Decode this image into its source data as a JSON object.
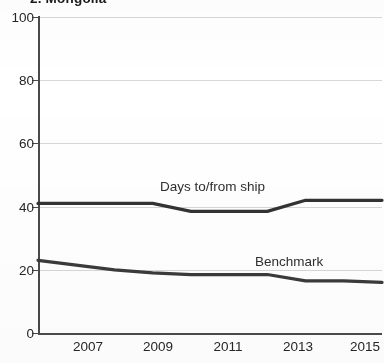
{
  "chart_data": {
    "type": "line",
    "title": "2. Mongolia",
    "xlabel": "",
    "ylabel": "",
    "xlim": [
      2006,
      2015
    ],
    "ylim": [
      0,
      100
    ],
    "grid": true,
    "legend_position": "inline-annotation",
    "x": [
      2006,
      2007,
      2008,
      2009,
      2010,
      2011,
      2012,
      2013,
      2014,
      2015
    ],
    "xtick_labels": [
      "2007",
      "2009",
      "2011",
      "2013",
      "2015"
    ],
    "xtick_values": [
      2007,
      2009,
      2011,
      2013,
      2015
    ],
    "ytick_labels": [
      "0",
      "20",
      "40",
      "60",
      "80",
      "100"
    ],
    "ytick_values": [
      0,
      20,
      40,
      60,
      80,
      100
    ],
    "series": [
      {
        "name": "Days to/from ship",
        "color": "#333333",
        "values": [
          41,
          41,
          41,
          41,
          38.5,
          38.5,
          38.5,
          42,
          42,
          42
        ]
      },
      {
        "name": "Benchmark",
        "color": "#3a3a3a",
        "values": [
          23,
          21.5,
          20,
          19,
          18.5,
          18.5,
          18.5,
          16.5,
          16.5,
          16
        ]
      }
    ]
  },
  "annotations": {
    "series_labels": [
      {
        "text": "Days to/from ship"
      },
      {
        "text": "Benchmark"
      }
    ]
  },
  "colors": {
    "axis": "#4a4a4a",
    "grid": "#c9c9c9",
    "text": "#262626",
    "line": "#333333",
    "background": "#ffffff"
  }
}
